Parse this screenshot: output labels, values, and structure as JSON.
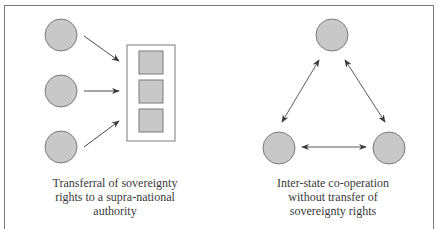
{
  "diagram": {
    "colors": {
      "node_fill": "#c8c8c8",
      "node_stroke": "#7a7a7a",
      "arrow": "#4a4a4a",
      "frame": "#7a7a7a",
      "text": "#3a3a3a"
    },
    "left_panel": {
      "title": "supra-national model",
      "nodes": [
        "state-1",
        "state-2",
        "state-3"
      ],
      "authority_box": {
        "units": 3
      },
      "caption_lines": [
        "Transferral of sovereignty",
        "rights to a supra-national",
        "authority"
      ]
    },
    "right_panel": {
      "title": "inter-state model",
      "nodes": [
        "state-top",
        "state-bottom-left",
        "state-bottom-right"
      ],
      "arrows": "bidirectional",
      "caption_lines": [
        "Inter-state co-operation",
        "without transfer of",
        "sovereignty rights"
      ]
    }
  }
}
